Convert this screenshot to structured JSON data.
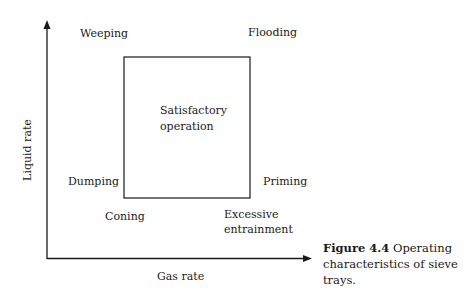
{
  "figure": {
    "caption_number": "Figure 4.4",
    "caption_text": " Operating characteristics of sieve trays."
  },
  "axes": {
    "xlabel": "Gas rate",
    "ylabel": "Liquid rate"
  },
  "regions": {
    "center": [
      "Satisfactory",
      "operation"
    ],
    "top_left": "Weeping",
    "top_right": "Flooding",
    "left": "Dumping",
    "right": "Priming",
    "bottom_left": "Coning",
    "bottom_right": [
      "Excessive",
      "entrainment"
    ]
  },
  "colors": {
    "ink": "#1a1a1a",
    "background": "#ffffff"
  }
}
